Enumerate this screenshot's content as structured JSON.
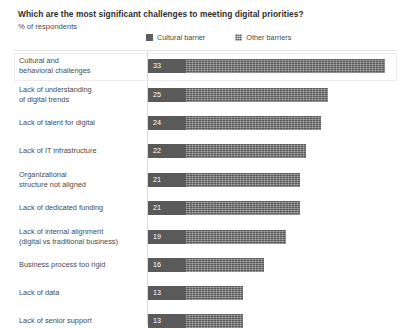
{
  "header": {
    "title": "Which are the most significant challenges to meeting digital priorities?",
    "subtitle": "% of respondents"
  },
  "legend": {
    "items": [
      {
        "label": "Cultural barrier",
        "swatch": "cultural-barrier-swatch",
        "color": "#5a5a5a"
      },
      {
        "label": "Other barriers",
        "swatch": "other-barriers-swatch",
        "color": "#595959"
      }
    ]
  },
  "chart_data": {
    "type": "bar",
    "orientation": "horizontal",
    "stacked": true,
    "title": "Which are the most significant challenges to meeting digital priorities?",
    "subtitle": "% of respondents",
    "xlabel": "",
    "ylabel": "",
    "xlim": [
      0,
      33
    ],
    "grid": false,
    "legend_position": "top",
    "categories": [
      "Cultural and\nbehavioral challenges",
      "Lack of understanding\nof digital trends",
      "Lack of talent for digital",
      "Lack of IT infrastructure",
      "Organizational\nstructure not aligned",
      "Lack of dedicated funding",
      "Lack of internal alignment\n(digital vs traditional business)",
      "Business process too rigid",
      "Lack of data",
      "Lack of senior support"
    ],
    "values": [
      33,
      25,
      24,
      22,
      21,
      21,
      19,
      16,
      13,
      13
    ],
    "value_labels": [
      "33",
      "25",
      "24",
      "22",
      "21",
      "21",
      "19",
      "16",
      "13",
      "13"
    ],
    "series": [
      {
        "name": "Cultural barrier",
        "values": [
          5.3,
          5.3,
          5.3,
          5.3,
          5.3,
          5.3,
          5.3,
          5.3,
          5.3,
          5.3
        ]
      },
      {
        "name": "Other barriers",
        "values": [
          27.7,
          19.7,
          18.7,
          16.7,
          15.7,
          15.7,
          13.7,
          10.7,
          7.7,
          7.7
        ]
      }
    ],
    "highlighted_category": "Cultural and\nbehavioral challenges"
  },
  "rows": [
    {
      "label": "Cultural and\nbehavioral challenges",
      "value": "33",
      "cultural_px": 38,
      "total_px": 237,
      "highlighted": true
    },
    {
      "label": "Lack of understanding\nof digital trends",
      "value": "25",
      "cultural_px": 38,
      "total_px": 180,
      "highlighted": false
    },
    {
      "label": "Lack of talent for digital",
      "value": "24",
      "cultural_px": 38,
      "total_px": 173,
      "highlighted": false
    },
    {
      "label": "Lack of IT infrastructure",
      "value": "22",
      "cultural_px": 38,
      "total_px": 158,
      "highlighted": false
    },
    {
      "label": "Organizational\nstructure not aligned",
      "value": "21",
      "cultural_px": 38,
      "total_px": 152,
      "highlighted": false
    },
    {
      "label": "Lack of dedicated funding",
      "value": "21",
      "cultural_px": 38,
      "total_px": 152,
      "highlighted": false
    },
    {
      "label": "Lack of internal alignment\n(digital vs traditional business)",
      "value": "19",
      "cultural_px": 38,
      "total_px": 138,
      "highlighted": false
    },
    {
      "label": "Business process too rigid",
      "value": "16",
      "cultural_px": 38,
      "total_px": 116,
      "highlighted": false
    },
    {
      "label": "Lack of data",
      "value": "13",
      "cultural_px": 38,
      "total_px": 95,
      "highlighted": false
    },
    {
      "label": "Lack of senior support",
      "value": "13",
      "cultural_px": 38,
      "total_px": 95,
      "highlighted": false
    }
  ]
}
